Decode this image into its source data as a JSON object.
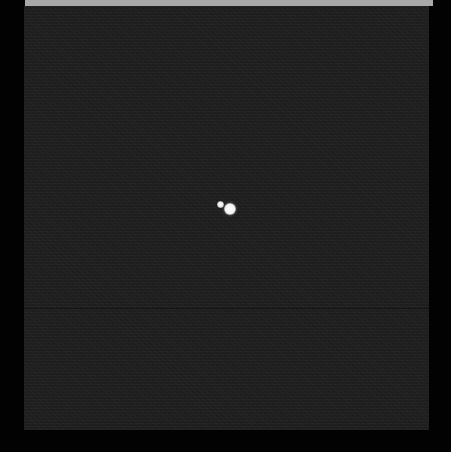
{
  "image": {
    "description": "Telescope image of a bright primary body with a smaller companion against a noisy dark sky",
    "colors": {
      "border": "#020202",
      "sky": "#1f1f1f",
      "top_bar": "#a9a9a9",
      "objects": "#ffffff"
    },
    "objects": [
      {
        "name": "companion",
        "cx": 220,
        "cy": 204,
        "r": 3
      },
      {
        "name": "primary",
        "cx": 230,
        "cy": 209,
        "r": 6
      }
    ]
  }
}
